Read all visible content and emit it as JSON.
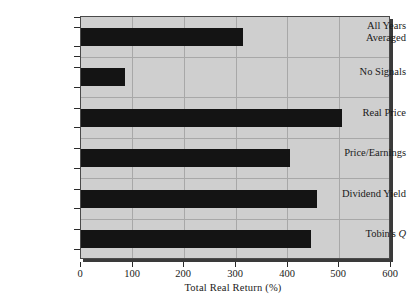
{
  "chart_data": {
    "type": "bar",
    "orientation": "horizontal",
    "title": "",
    "xlabel": "Total Real Return (%)",
    "ylabel": "",
    "categories": [
      "All Years\nAveraged",
      "No Signals",
      "Real Price",
      "Price/Earnings",
      "Dividend Yield",
      "Tobin's Q"
    ],
    "values": [
      314,
      85,
      505,
      404,
      457,
      445
    ],
    "xlim": [
      0,
      600
    ],
    "xticks": [
      0,
      100,
      200,
      300,
      400,
      500,
      600
    ],
    "xticklabels": [
      "0",
      "100",
      "200",
      "300",
      "400",
      "500",
      "600"
    ],
    "grid": true,
    "legend": "none",
    "bar_color": "#141414",
    "plot_background": "#cfcfcf",
    "grid_color": "#a8a8a8",
    "axis_color": "#2a2a2a"
  },
  "axis": {
    "x_title": "Total Real Return (%)"
  },
  "bars": [
    {
      "label": "All Years\nAveraged",
      "value": 314,
      "italic_tail": ""
    },
    {
      "label": "No Signals",
      "value": 85,
      "italic_tail": ""
    },
    {
      "label": "Real Price",
      "value": 505,
      "italic_tail": ""
    },
    {
      "label": "Price/Earnings",
      "value": 404,
      "italic_tail": ""
    },
    {
      "label": "Dividend Yield",
      "value": 457,
      "italic_tail": ""
    },
    {
      "label": "Tobin's ",
      "value": 445,
      "italic_tail": "Q"
    }
  ]
}
